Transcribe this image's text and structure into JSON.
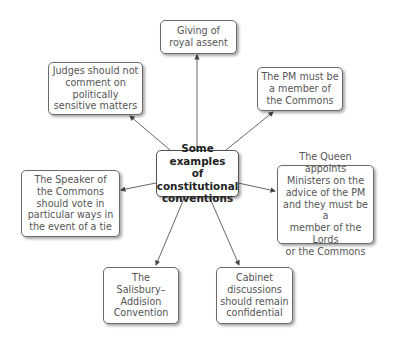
{
  "diagram": {
    "type": "mind-map",
    "center": {
      "label": "Some examples\nof constitutional\nconventions"
    },
    "nodes": [
      {
        "id": "royal-assent",
        "label": "Giving of\nroyal assent"
      },
      {
        "id": "judges",
        "label": "Judges should not\ncomment on\npolitically\nsensitive matters"
      },
      {
        "id": "pm-commons",
        "label": "The PM must be\na member of\nthe Commons"
      },
      {
        "id": "speaker",
        "label": "The Speaker of\nthe Commons\nshould vote in\nparticular ways in\nthe event of a tie"
      },
      {
        "id": "queen-ministers",
        "label": "The Queen appoints\nMinisters on the\nadvice of the PM\nand they must be a\nmember of the Lords\nor the Commons"
      },
      {
        "id": "salisbury",
        "label": "The\nSalisbury–\nAddision\nConvention"
      },
      {
        "id": "cabinet",
        "label": "Cabinet\ndiscussions\nshould remain\nconfidential"
      }
    ],
    "edges": [
      {
        "from": "center",
        "to": "royal-assent"
      },
      {
        "from": "center",
        "to": "judges"
      },
      {
        "from": "center",
        "to": "pm-commons"
      },
      {
        "from": "center",
        "to": "speaker"
      },
      {
        "from": "center",
        "to": "queen-ministers"
      },
      {
        "from": "center",
        "to": "salisbury"
      },
      {
        "from": "center",
        "to": "cabinet"
      }
    ],
    "colors": {
      "border": "#6b6b6b",
      "text": "#555555",
      "center_text": "#222222",
      "arrow": "#444444"
    }
  }
}
